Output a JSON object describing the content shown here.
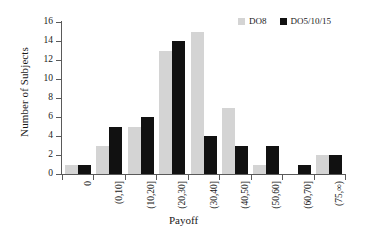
{
  "chart_data": {
    "type": "bar",
    "title": "",
    "xlabel": "Payoff",
    "ylabel": "Number of Subjects",
    "categories": [
      "0",
      "(0,10]",
      "(10,20]",
      "(20,30]",
      "(30,40]",
      "(40,50]",
      "(50,60]",
      "(60,70]",
      "(75,∞)"
    ],
    "series": [
      {
        "name": "DO8",
        "color": "#d4d4d4",
        "values": [
          1,
          3,
          5,
          13,
          15,
          7,
          1,
          0,
          2
        ]
      },
      {
        "name": "DO5/10/15",
        "color": "#111111",
        "values": [
          1,
          5,
          6,
          14,
          4,
          3,
          3,
          1,
          2
        ]
      }
    ],
    "ylim": [
      0,
      16
    ],
    "y_ticks": [
      0,
      2,
      4,
      6,
      8,
      10,
      12,
      14,
      16
    ],
    "y_tick_labels": [
      "0",
      "2",
      "4",
      "6",
      "8",
      "10",
      "12",
      "14",
      "16"
    ],
    "grid": false,
    "legend_position": "top-right"
  }
}
